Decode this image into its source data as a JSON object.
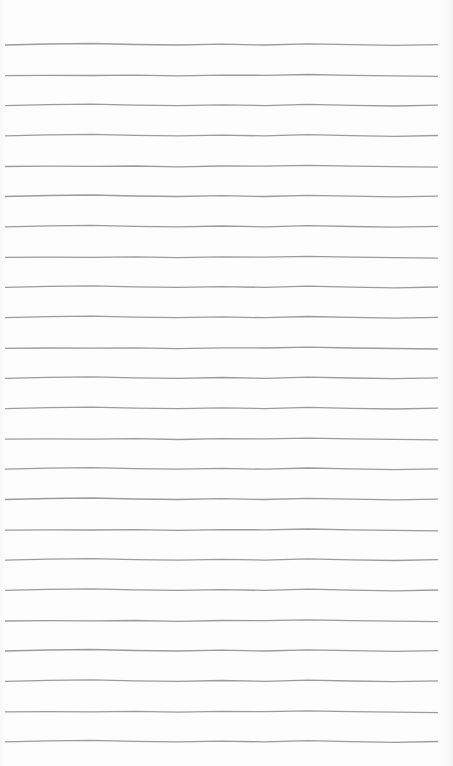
{
  "page": {
    "type": "lined-paper",
    "line_count": 24,
    "line_color": "#9c9c9c",
    "background_color": "#fdfdfd",
    "first_line_y": 45,
    "line_spacing": 30.3,
    "line_x_start": 5,
    "line_x_end": 438
  }
}
